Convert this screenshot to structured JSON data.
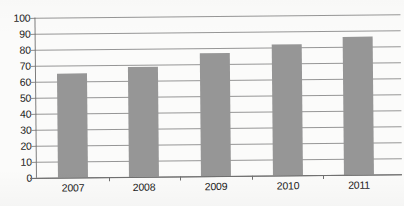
{
  "chart_data": {
    "type": "bar",
    "title": "",
    "subtitle": "",
    "xlabel": "",
    "ylabel": "",
    "categories": [
      "2007",
      "2008",
      "2009",
      "2010",
      "2011"
    ],
    "values": [
      65,
      69,
      77,
      82,
      86
    ],
    "series": [
      {
        "name": "",
        "values": [
          65,
          69,
          77,
          82,
          86
        ]
      }
    ],
    "ylim": [
      0,
      100
    ],
    "y_ticks": [
      0,
      10,
      20,
      30,
      40,
      50,
      60,
      70,
      80,
      90,
      100
    ],
    "y_tick_labels": [
      "0",
      "10",
      "20",
      "30",
      "40",
      "50",
      "60",
      "70",
      "80",
      "90",
      "100"
    ],
    "grid": true,
    "grid_axis": "y",
    "legend": false,
    "legend_position": "none",
    "bar_color": "#969696",
    "gridline_color": "#8d8d8d",
    "axis_color": "#6f6f6f",
    "text_color": "#1b1b1b",
    "background_color": "#fbfbfa",
    "annotations": []
  }
}
